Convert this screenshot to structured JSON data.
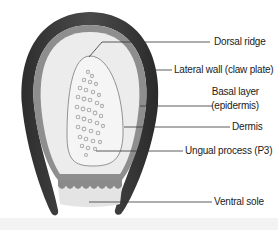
{
  "figure": {
    "labels": [
      {
        "id": "dorsal_ridge",
        "text": "Dorsal ridge"
      },
      {
        "id": "lateral_wall",
        "text": "Lateral wall (claw plate)"
      },
      {
        "id": "basal_layer_1",
        "text": "Basal layer"
      },
      {
        "id": "basal_layer_2",
        "text": "(epidermis)"
      },
      {
        "id": "dermis",
        "text": "Dermis"
      },
      {
        "id": "ungual_process",
        "text": "Ungual process (P3)"
      },
      {
        "id": "ventral_sole",
        "text": "Ventral sole"
      }
    ],
    "colors": {
      "claw_plate": "#3a3a3a",
      "basal_layer": "#8c8c8c",
      "dermis": "#ececec",
      "bone": "#f4f4f4",
      "bone_texture": "#b5b5b5",
      "sole": "#e6e6e6",
      "leader_line": "#333333"
    }
  }
}
